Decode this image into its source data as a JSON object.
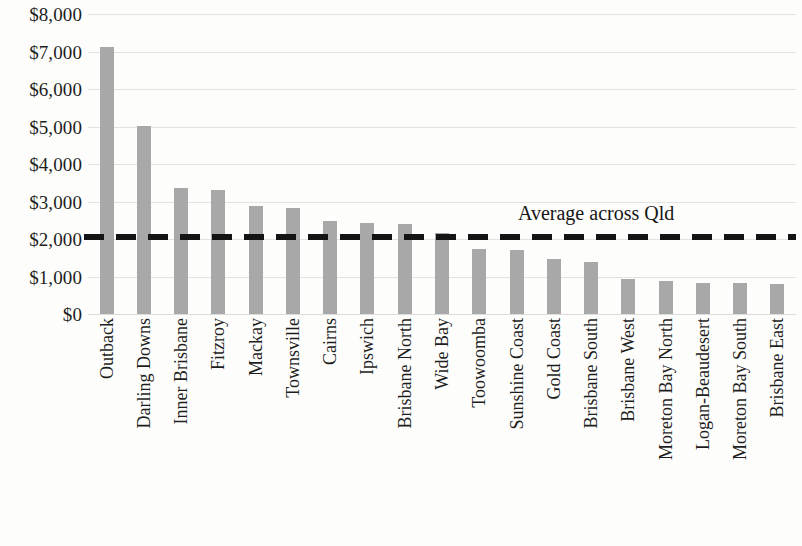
{
  "chart_data": {
    "type": "bar",
    "title": "",
    "subtitle": "",
    "xlabel": "",
    "ylabel": "",
    "ylim": [
      0,
      8000
    ],
    "ytick_step": 1000,
    "grid": true,
    "legend_position": "none",
    "bar_color": "#a8a8a8",
    "reference_line_color": "#141414",
    "categories": [
      "Outback",
      "Darling Downs",
      "Inner Brisbane",
      "Fitzroy",
      "Mackay",
      "Townsville",
      "Cairns",
      "Ipswich",
      "Brisbane North",
      "Wide Bay",
      "Toowoomba",
      "Sunshine Coast",
      "Gold Coast",
      "Brisbane South",
      "Brisbane West",
      "Moreton Bay North",
      "Logan-Beaudesert",
      "Moreton Bay South",
      "Brisbane East"
    ],
    "values": [
      7130,
      5010,
      3350,
      3320,
      2880,
      2830,
      2470,
      2440,
      2400,
      2170,
      1730,
      1700,
      1460,
      1390,
      940,
      880,
      840,
      840,
      790
    ],
    "ytick_labels": [
      "$8,000",
      "$7,000",
      "$6,000",
      "$5,000",
      "$4,000",
      "$3,000",
      "$2,000",
      "$1,000",
      "$0"
    ],
    "ytick_values": [
      8000,
      7000,
      6000,
      5000,
      4000,
      3000,
      2000,
      1000,
      0
    ],
    "reference_line": {
      "label": "Average across Qld",
      "value": 2050,
      "style": "dashed"
    }
  }
}
